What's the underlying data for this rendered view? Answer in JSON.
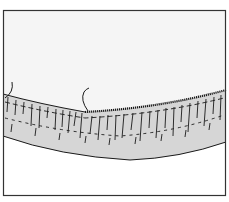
{
  "figure": {
    "colors": {
      "background": "#ffffff",
      "upper_region": "#f4f4f4",
      "band_fill": "#d9d9d9",
      "line": "#1a1a1a",
      "frame": "#333333"
    },
    "frame": {
      "x": 3,
      "y": 10,
      "width": 223,
      "height": 186
    }
  }
}
